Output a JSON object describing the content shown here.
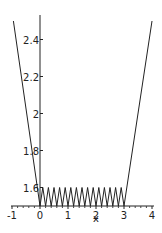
{
  "chart_data": {
    "type": "line",
    "title": "",
    "xlabel": "x",
    "ylabel": "",
    "xlim": [
      -1,
      4
    ],
    "ylim": [
      1.5,
      2.5
    ],
    "x_ticks": [
      "-1",
      "0",
      "1",
      "2",
      "3",
      "4"
    ],
    "y_ticks": [
      "1.6",
      "1.8",
      "2",
      "2.2",
      "2.4"
    ],
    "grid": false,
    "series": [
      {
        "name": "f(x)",
        "description": "Piecewise: steep line descending from (-0.95,2.5) to (0,1.5); sawtooth oscillating between 1.5 and 1.6 with period 0.2 on [0,3]; steep line rising from (3,1.5) to (4,2.5)",
        "x": [
          -0.95,
          0,
          0.1,
          0.2,
          0.3,
          0.4,
          0.5,
          0.6,
          0.7,
          0.8,
          0.9,
          1.0,
          1.1,
          1.2,
          1.3,
          1.4,
          1.5,
          1.6,
          1.7,
          1.8,
          1.9,
          2.0,
          2.1,
          2.2,
          2.3,
          2.4,
          2.5,
          2.6,
          2.7,
          2.8,
          2.9,
          3.0,
          4.0
        ],
        "y": [
          2.5,
          1.5,
          1.6,
          1.5,
          1.6,
          1.5,
          1.6,
          1.5,
          1.6,
          1.5,
          1.6,
          1.5,
          1.6,
          1.5,
          1.6,
          1.5,
          1.6,
          1.5,
          1.6,
          1.5,
          1.6,
          1.5,
          1.6,
          1.5,
          1.6,
          1.5,
          1.6,
          1.5,
          1.6,
          1.5,
          1.6,
          1.5,
          2.5
        ]
      }
    ]
  },
  "axes": {
    "x_label": "x",
    "x_tick_labels": [
      "-1",
      "0",
      "1",
      "2",
      "3",
      "4"
    ],
    "y_tick_labels": [
      "1.6",
      "1.8",
      "2",
      "2.2",
      "2.4"
    ]
  }
}
